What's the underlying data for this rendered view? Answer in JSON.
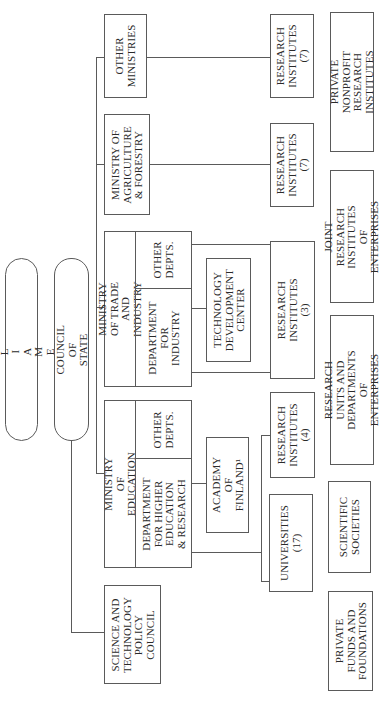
{
  "diagram": {
    "orientation": "rotated-90-ccw",
    "nodes": {
      "parliament": "P A R L I A M E N T",
      "council_of_state": "COUNCIL OF STATE",
      "science_council": "SCIENCE AND\nTECHNOLOGY\nPOLICY\nCOUNCIL",
      "ministry_education": "MINISTRY OF EDUCATION",
      "dept_higher_education": "DEPARTMENT\nFOR HIGHER\nEDUCATION\n& RESEARCH",
      "education_other_depts": "OTHER\nDEPTS.",
      "ministry_trade": "MINISTRY OF TRADE\nAND INDUSTRY",
      "dept_industry": "DEPARTMENT\nFOR\nINDUSTRY",
      "trade_other_depts": "OTHER\nDEPTS.",
      "ministry_agriculture": "MINISTRY OF\nAGRICULTURE\n& FORESTRY",
      "other_ministries": "OTHER\nMINISTRIES",
      "academy_of_finland": "ACADEMY OF\nFINLAND¹",
      "technology_development_center": "TECHNOLOGY\nDEVELOPMENT\nCENTER",
      "universities": "UNIVERSITIES\n(17)",
      "research_institutes_education": "RESEARCH\nINSTITUTES\n(4)",
      "research_institutes_trade": "RESEARCH\nINSTITUTES\n(3)",
      "research_institutes_agriculture": "RESEARCH\nINSTITUTES\n(7)",
      "research_institutes_other": "RESEARCH\nINSTITUTES\n(7)",
      "private_funds": "PRIVATE\nFUNDS AND\nFOUNDATIONS",
      "scientific_societies": "SCIENTIFIC\nSOCIETIES",
      "research_units_enterprises": "RESEARCH UNITS AND\nDEPARTMENTS OF\nENTERPRISES",
      "joint_research_institutes": "JOINT RESEARCH\nINSTITUTES OF\nENTERPRISES",
      "private_nonprofit": "PRIVATE NONPROFIT\nRESEARCH\nINSTITUTES"
    }
  }
}
